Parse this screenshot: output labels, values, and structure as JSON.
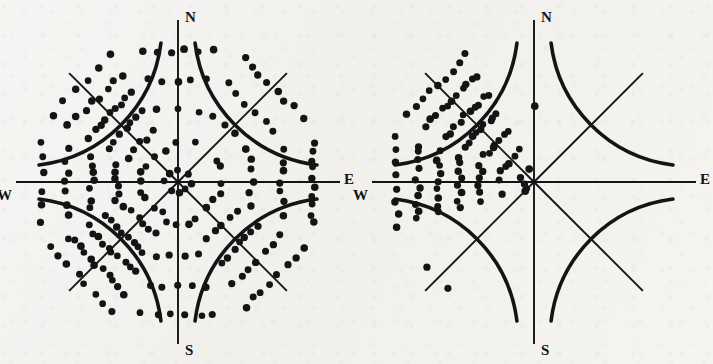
{
  "figure": {
    "background_color": "#f4f3f1",
    "ink_color": "#141414",
    "width": 713,
    "height": 364
  },
  "chart_data": {
    "type": "scatter",
    "chart_kind": "wind-rose-dot-diagram",
    "title": "",
    "subtitle": "",
    "xlabel": "",
    "ylabel": "",
    "grid": false,
    "legend": "none",
    "categories": [
      "N",
      "NE",
      "E",
      "SE",
      "S",
      "SW",
      "W",
      "NW"
    ],
    "series": [
      {
        "name": "Diagram 1 (left)",
        "values": [
          16,
          21,
          26,
          31,
          16,
          47,
          30,
          39
        ]
      },
      {
        "name": "Diagram 2 (right)",
        "values": [
          1,
          0,
          0,
          0,
          0,
          4,
          45,
          52
        ]
      }
    ],
    "axis_labels": [
      "N",
      "E",
      "S",
      "W"
    ]
  },
  "diagrams": [
    {
      "id": "left-rose",
      "name": "dot-rose-left",
      "center": {
        "x": 178,
        "y": 182
      },
      "radius": 140,
      "labels": {
        "north": "N",
        "east": "E",
        "south": "S",
        "west": "W"
      },
      "sectors": [
        {
          "direction": "N",
          "name": "sector-n",
          "angle_deg": 90,
          "count": 16,
          "rows": [
            1,
            1,
            3,
            5,
            6
          ],
          "outer": 0.94,
          "spread": 0.52
        },
        {
          "direction": "NE",
          "name": "sector-ne",
          "angle_deg": 45,
          "count": 21,
          "rows": [
            1,
            2,
            4,
            6,
            8
          ],
          "outer": 0.96,
          "spread": 0.6
        },
        {
          "direction": "E",
          "name": "sector-e",
          "angle_deg": 0,
          "count": 26,
          "rows": [
            1,
            3,
            5,
            7,
            10
          ],
          "outer": 0.96,
          "spread": 0.58
        },
        {
          "direction": "SE",
          "name": "sector-se",
          "angle_deg": -45,
          "count": 31,
          "rows": [
            1,
            3,
            5,
            7,
            7,
            8
          ],
          "outer": 0.97,
          "spread": 0.6
        },
        {
          "direction": "S",
          "name": "sector-s",
          "angle_deg": -90,
          "count": 16,
          "rows": [
            1,
            3,
            4,
            5,
            6
          ],
          "outer": 0.95,
          "spread": 0.52
        },
        {
          "direction": "SW",
          "name": "sector-sw",
          "angle_deg": -135,
          "count": 47,
          "rows": [
            1,
            3,
            6,
            8,
            10,
            11,
            8
          ],
          "outer": 0.98,
          "spread": 0.66
        },
        {
          "direction": "W",
          "name": "sector-w",
          "angle_deg": 180,
          "count": 30,
          "rows": [
            1,
            3,
            6,
            7,
            7,
            6
          ],
          "outer": 0.97,
          "spread": 0.56
        },
        {
          "direction": "NW",
          "name": "sector-nw",
          "angle_deg": 135,
          "count": 39,
          "rows": [
            1,
            3,
            5,
            7,
            9,
            8,
            6
          ],
          "outer": 0.98,
          "spread": 0.62
        }
      ]
    },
    {
      "id": "right-rose",
      "name": "dot-rose-right",
      "center": {
        "x": 534,
        "y": 182
      },
      "radius": 140,
      "labels": {
        "north": "N",
        "east": "E",
        "south": "S",
        "west": "W"
      },
      "sectors": [
        {
          "direction": "N",
          "name": "sector-n",
          "angle_deg": 90,
          "count": 1,
          "rows": [
            1
          ],
          "outer": 0.93,
          "spread": 0.2
        },
        {
          "direction": "NE",
          "name": "sector-ne",
          "angle_deg": 45,
          "count": 0,
          "rows": [],
          "outer": 0.95,
          "spread": 0.55
        },
        {
          "direction": "E",
          "name": "sector-e",
          "angle_deg": 0,
          "count": 0,
          "rows": [],
          "outer": 0.95,
          "spread": 0.55
        },
        {
          "direction": "SE",
          "name": "sector-se",
          "angle_deg": -45,
          "count": 0,
          "rows": [],
          "outer": 0.95,
          "spread": 0.55
        },
        {
          "direction": "S",
          "name": "sector-s",
          "angle_deg": -90,
          "count": 0,
          "rows": [],
          "outer": 0.95,
          "spread": 0.55
        },
        {
          "direction": "SW",
          "name": "sector-sw",
          "angle_deg": -135,
          "count": 4,
          "rows": [
            2,
            2
          ],
          "outer": 0.97,
          "spread": 0.22
        },
        {
          "direction": "W",
          "name": "sector-w",
          "angle_deg": 180,
          "count": 45,
          "rows": [
            1,
            3,
            6,
            8,
            9,
            10,
            8
          ],
          "outer": 0.98,
          "spread": 0.62
        },
        {
          "direction": "NW",
          "name": "sector-nw",
          "angle_deg": 135,
          "count": 52,
          "rows": [
            2,
            4,
            7,
            9,
            10,
            11,
            9
          ],
          "outer": 0.98,
          "spread": 0.6
        }
      ]
    }
  ]
}
